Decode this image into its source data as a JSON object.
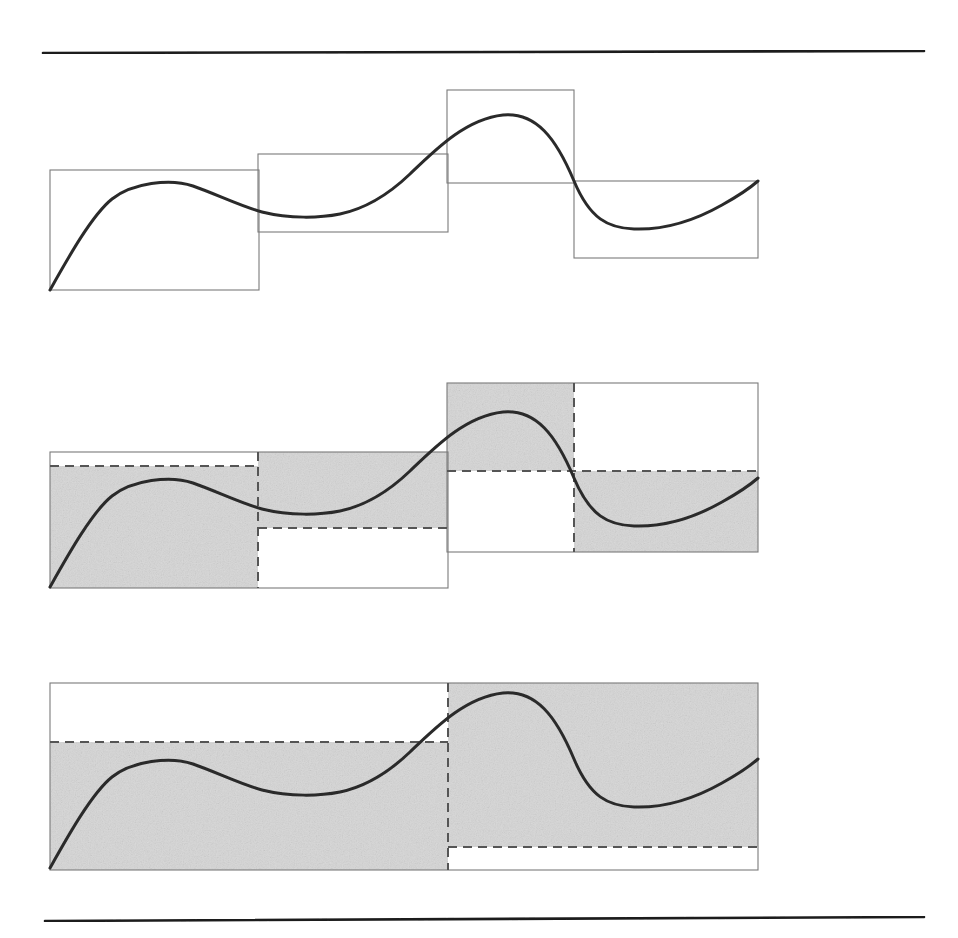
{
  "figure": {
    "panel_count": 3,
    "background_color": "#ffffff",
    "curve_color": "#2b2b2b",
    "box_stroke_color": "#7a7a7a",
    "rule_color": "#1a1a1a",
    "shade_color": "#d6d6d6",
    "dashed_color": "#555555",
    "curve_stroke_width": 3.0,
    "box_stroke_width": 1.1,
    "rule_stroke_width": 2.6,
    "dash_pattern": "9,6"
  },
  "rules": {
    "top": {
      "label": "top-rule",
      "x1": 43,
      "y1": 53,
      "x2": 924,
      "y2": 51
    },
    "bottom": {
      "label": "bottom-rule",
      "x1": 45,
      "y1": 921,
      "x2": 924,
      "y2": 917
    }
  },
  "chart_data": {
    "type": "line",
    "subtitle": "Three successive levels of piecewise-constant approximation",
    "xlabel": "",
    "ylabel": "",
    "grid": false,
    "legend": null,
    "axis_ranges": {
      "x": [
        0,
        1
      ],
      "y": [
        0,
        1
      ]
    },
    "series": [
      {
        "name": "signal",
        "description": "Smooth S-shaped wave: rises from zero, local maximum, local minimum, large peak, deep trough, rises again",
        "x": [
          0.0,
          0.05,
          0.1,
          0.137,
          0.2,
          0.27,
          0.34,
          0.407,
          0.47,
          0.535,
          0.6,
          0.64,
          0.7,
          0.77,
          0.845,
          0.92,
          1.0
        ],
        "y": [
          0.0,
          0.35,
          0.56,
          0.62,
          0.618,
          0.56,
          0.49,
          0.5,
          0.61,
          0.79,
          0.91,
          0.88,
          0.7,
          0.48,
          0.39,
          0.42,
          0.56
        ]
      }
    ],
    "levels": [
      {
        "level": 1,
        "name": "level-1-four-boxes",
        "panel": "top",
        "box_count": 4,
        "description": "Four boxes, each the mean of the curve over a quarter-interval. Boxes drawn as unfilled outlines.",
        "boxes": [
          {
            "index": 0,
            "x_start": 0.0,
            "x_end": 0.295,
            "mean_value": 0.47,
            "shaded": false
          },
          {
            "index": 1,
            "x_start": 0.295,
            "x_end": 0.563,
            "mean_value": 0.55,
            "shaded": false
          },
          {
            "index": 2,
            "x_start": 0.563,
            "x_end": 0.742,
            "mean_value": 0.79,
            "shaded": false
          },
          {
            "index": 3,
            "x_start": 0.742,
            "x_end": 1.0,
            "mean_value": 0.43,
            "shaded": false
          }
        ]
      },
      {
        "level": 2,
        "name": "level-2-two-boxes",
        "panel": "middle",
        "box_count": 2,
        "description": "Two boxes spanning halves of the domain. Each box is split by a dashed line into a shaded part and an unshaded part showing the detail (difference) coefficient.",
        "boxes": [
          {
            "index": 0,
            "x_start": 0.0,
            "x_end": 0.563,
            "mean_value": 0.51,
            "left_sub_value": 0.47,
            "right_sub_value": 0.55,
            "shaded": true
          },
          {
            "index": 1,
            "x_start": 0.563,
            "x_end": 1.0,
            "mean_value": 0.6,
            "left_sub_value": 0.79,
            "right_sub_value": 0.43,
            "shaded": true
          }
        ]
      },
      {
        "level": 3,
        "name": "level-3-one-box",
        "panel": "bottom",
        "box_count": 1,
        "description": "Single box spanning the whole domain: the overall mean. Dashed lines mark the two level-2 means inside it.",
        "boxes": [
          {
            "index": 0,
            "x_start": 0.0,
            "x_end": 1.0,
            "mean_value": 0.555,
            "left_sub_value": 0.51,
            "right_sub_value": 0.6,
            "shaded": true
          }
        ]
      }
    ]
  },
  "geometry": {
    "panels": [
      {
        "name": "panel-top",
        "level": 1,
        "curve_path": "M 50 290 C 68 258 92 215 112 199 C 132 183 170 178 193 186 C 216 194 240 206 262 212 C 290 219 320 218 340 214 C 364 209 388 195 410 174 C 436 149 466 119 503 115 C 536 112 556 138 574 181 C 590 219 608 228 634 229 C 662 230 692 222 722 205 C 740 195 750 188 758 181",
        "boxes": [
          {
            "name": "box-1",
            "x": 50,
            "y": 170,
            "w": 209,
            "h": 120,
            "shaded": false
          },
          {
            "name": "box-2",
            "x": 258,
            "y": 154,
            "w": 190,
            "h": 78,
            "shaded": false
          },
          {
            "name": "box-3",
            "x": 447,
            "y": 90,
            "w": 127,
            "h": 93,
            "shaded": false
          },
          {
            "name": "box-4",
            "x": 574,
            "y": 181,
            "w": 184,
            "h": 77,
            "shaded": false
          }
        ]
      },
      {
        "name": "panel-middle",
        "level": 2,
        "curve_path": "M 50 587 C 68 555 92 512 112 496 C 132 480 170 475 193 483 C 216 491 240 503 262 509 C 290 516 320 515 340 511 C 364 506 388 492 410 471 C 436 446 466 416 503 412 C 536 409 556 435 574 478 C 590 516 608 525 634 526 C 662 527 692 519 722 502 C 740 492 750 485 758 478",
        "boxes": [
          {
            "name": "box-a",
            "outer": {
              "x": 50,
              "y": 452,
              "w": 398,
              "h": 136
            },
            "split_x": 258,
            "left_dash_y": 466,
            "right_dash_y": 528,
            "left_shade": {
              "x": 50,
              "y": 466,
              "w": 208,
              "h": 122
            },
            "right_shade": {
              "x": 258,
              "y": 452,
              "w": 190,
              "h": 76
            }
          },
          {
            "name": "box-b",
            "outer": {
              "x": 447,
              "y": 383,
              "w": 311,
              "h": 169
            },
            "split_x": 574,
            "left_dash_y": 471,
            "right_dash_y": 471,
            "left_shade": {
              "x": 447,
              "y": 383,
              "w": 127,
              "h": 88
            },
            "right_shade": {
              "x": 574,
              "y": 471,
              "w": 184,
              "h": 81
            }
          }
        ]
      },
      {
        "name": "panel-bottom",
        "level": 3,
        "curve_path": "M 50 868 C 68 836 92 793 112 777 C 132 761 170 756 193 764 C 216 772 240 784 262 790 C 290 797 320 796 340 792 C 364 787 388 773 410 752 C 436 727 466 697 503 693 C 536 690 556 716 574 759 C 590 797 608 806 634 807 C 662 808 692 800 722 783 C 740 773 750 766 758 759",
        "boxes": [
          {
            "name": "box-whole",
            "outer": {
              "x": 50,
              "y": 683,
              "w": 708,
              "h": 187
            },
            "split_x": 448,
            "left_dash_y": 742,
            "right_dash_y": 847,
            "left_shade": {
              "x": 50,
              "y": 742,
              "w": 398,
              "h": 128
            },
            "right_shade": {
              "x": 448,
              "y": 683,
              "w": 310,
              "h": 164
            }
          }
        ]
      }
    ]
  }
}
